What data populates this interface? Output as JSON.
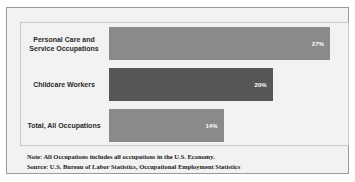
{
  "title_remnant": "",
  "chart_data": {
    "type": "bar",
    "orientation": "horizontal",
    "title": "",
    "xlabel": "",
    "ylabel": "",
    "categories": [
      "Personal Care and Service Occupations",
      "Childcare Workers",
      "Total, All Occupations"
    ],
    "values": [
      27,
      20,
      14
    ],
    "value_labels": [
      "27%",
      "20%",
      "14%"
    ],
    "bar_colors": [
      "#8a8a8a",
      "#565656",
      "#8a8a8a"
    ],
    "xlim": [
      0,
      28
    ],
    "grid": false,
    "legend": null
  },
  "bars": [
    {
      "label_line1": "Personal Care and",
      "label_line2": "Service Occupations",
      "value_label": "27%"
    },
    {
      "label_line1": "Childcare Workers",
      "label_line2": "",
      "value_label": "20%"
    },
    {
      "label_line1": "Total, All Occupations",
      "label_line2": "",
      "value_label": "14%"
    }
  ],
  "footnotes": {
    "note": "Note: All Occupations includes all occupations in the U.S. Economy.",
    "source": "Source: U.S. Bureau of Labor Statistics, Occupational Employment Statistics"
  },
  "colors": {
    "bar_light": "#8a8a8a",
    "bar_dark": "#565656",
    "panel_background": "#f2f2f2",
    "outer_border": "#9a9a9a",
    "inner_border": "#c9c9c9",
    "label_text": "#2a2a2a",
    "value_text": "#ffffff"
  }
}
